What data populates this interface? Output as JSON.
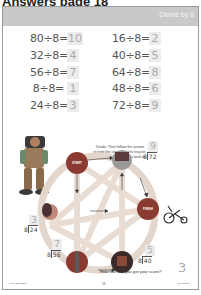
{
  "header": {
    "title": "Answers page 18"
  },
  "band": {
    "title": "Divide by 8",
    "color": "#c9c9c9"
  },
  "equations": {
    "left": [
      {
        "expr": "80÷8=",
        "answer": "10"
      },
      {
        "expr": "32÷8=",
        "answer": "4"
      },
      {
        "expr": "56÷8=",
        "answer": "7"
      },
      {
        "expr": "8÷8=",
        "answer": "1"
      },
      {
        "expr": "24÷8=",
        "answer": "3"
      }
    ],
    "right": [
      {
        "expr": "16÷8=",
        "answer": "2"
      },
      {
        "expr": "40÷8=",
        "answer": "5"
      },
      {
        "expr": "64÷8=",
        "answer": "8"
      },
      {
        "expr": "48÷8=",
        "answer": "6"
      },
      {
        "expr": "72÷8=",
        "answer": "9"
      }
    ]
  },
  "instructions": {
    "line1": "Divide. Then follow the arrows",
    "line2": "to help the clown find his tricycle.",
    "line3": "Add up the numbers you land on."
  },
  "wheel": {
    "start_label": "START",
    "finish_label": "FINISH",
    "node_color": "#8a3a30",
    "divisions": [
      {
        "id": "top-right",
        "divisor": "8",
        "dividend": "72",
        "answer": "9"
      },
      {
        "id": "left",
        "divisor": "8",
        "dividend": "24",
        "answer": "3"
      },
      {
        "id": "bottom-left",
        "divisor": "8",
        "dividend": "56",
        "answer": "7"
      },
      {
        "id": "bottom-right",
        "divisor": "8",
        "dividend": "40",
        "answer": "5"
      }
    ]
  },
  "score": {
    "question": "How low can you get your score?",
    "answer": "3"
  },
  "footer": {
    "left": "KS ANSWERS",
    "page": "18",
    "right": "DIVISION"
  }
}
